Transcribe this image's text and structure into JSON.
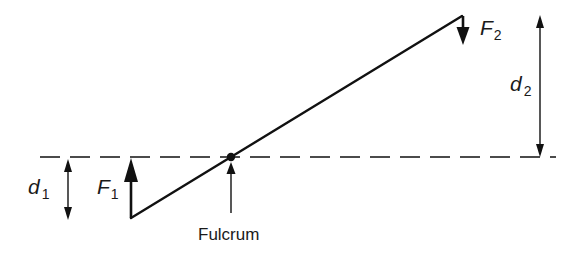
{
  "diagram": {
    "type": "lever",
    "colors": {
      "stroke": "#111111",
      "background": "#ffffff",
      "text": "#1a1a1a"
    },
    "reference_line": {
      "style": "dashed",
      "y": 157,
      "x_start": 40,
      "x_end": 556
    },
    "lever": {
      "x1": 131,
      "y1": 218,
      "x2": 462,
      "y2": 16
    },
    "fulcrum": {
      "label": "Fulcrum",
      "point": {
        "x": 231,
        "y": 157
      }
    },
    "forces": [
      {
        "id": "F1",
        "symbol": "F",
        "subscript": "1",
        "direction": "up"
      },
      {
        "id": "F2",
        "symbol": "F",
        "subscript": "2",
        "direction": "down"
      }
    ],
    "distances": [
      {
        "id": "d1",
        "symbol": "d",
        "subscript": "1"
      },
      {
        "id": "d2",
        "symbol": "d",
        "subscript": "2"
      }
    ]
  }
}
